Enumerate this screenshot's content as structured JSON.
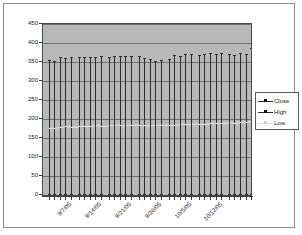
{
  "chart_data": {
    "type": "line",
    "title": "",
    "xlabel": "",
    "ylabel": "",
    "ylim": [
      0,
      450
    ],
    "ytick_labels": [
      "450",
      "400",
      "350",
      "300",
      "250",
      "200",
      "150",
      "100",
      "50",
      "0"
    ],
    "ytick_values": [
      450,
      400,
      350,
      300,
      250,
      200,
      150,
      100,
      50,
      0
    ],
    "grid": true,
    "legend_position": "right",
    "xtick_labels": [
      "9/7/05",
      "9/14/05",
      "9/21/05",
      "9/28/05",
      "10/5/05",
      "10/12/05"
    ],
    "xtick_positions": [
      3,
      8,
      13,
      18,
      23,
      28
    ],
    "categories": [
      "9/1/05",
      "9/2/05",
      "9/6/05",
      "9/7/05",
      "9/8/05",
      "9/9/05",
      "9/12/05",
      "9/13/05",
      "9/14/05",
      "9/15/05",
      "9/16/05",
      "9/19/05",
      "9/20/05",
      "9/21/05",
      "9/22/05",
      "9/23/05",
      "9/26/05",
      "9/27/05",
      "9/28/05",
      "9/29/05",
      "9/30/05",
      "10/3/05",
      "10/4/05",
      "10/5/05",
      "10/6/05",
      "10/7/05",
      "10/10/05",
      "10/11/05",
      "10/12/05",
      "10/13/05",
      "10/14/05",
      "10/17/05",
      "10/18/05",
      "10/19/05",
      "10/20/05"
    ],
    "series": [
      {
        "name": "High",
        "color": "#2b2b2b",
        "values": [
          355,
          352,
          362,
          360,
          363,
          362,
          363,
          364,
          364,
          365,
          364,
          367,
          366,
          365,
          367,
          366,
          361,
          357,
          353,
          356,
          358,
          368,
          367,
          370,
          372,
          368,
          371,
          374,
          372,
          373,
          370,
          369,
          374,
          372,
          388
        ]
      },
      {
        "name": "Low",
        "color": "#e8e8e8",
        "values": [
          176,
          177,
          180,
          181,
          180,
          181,
          182,
          182,
          183,
          182,
          183,
          183,
          184,
          183,
          184,
          185,
          184,
          183,
          183,
          184,
          185,
          185,
          186,
          187,
          186,
          187,
          188,
          189,
          190,
          190,
          191,
          190,
          192,
          193,
          196
        ]
      },
      {
        "name": "Close",
        "color": "#3a3a3a",
        "values": [
          178,
          179,
          182,
          183,
          182,
          183,
          184,
          184,
          185,
          184,
          185,
          185,
          186,
          185,
          186,
          187,
          186,
          185,
          185,
          186,
          187,
          187,
          188,
          189,
          188,
          189,
          190,
          191,
          192,
          192,
          193,
          192,
          194,
          195,
          198
        ]
      }
    ]
  },
  "legend": {
    "items": [
      {
        "label": "Close",
        "color": "#2b2b2b",
        "marker": "square-line"
      },
      {
        "label": "High",
        "color": "#2b2b2b",
        "marker": "square-line"
      },
      {
        "label": "Low",
        "color": "#dcdcdc",
        "marker": "square"
      }
    ]
  },
  "colors": {
    "plot_background": "#b8b8b8",
    "gridline": "#6f6f6f",
    "axis": "#3a3a3a",
    "page_background": "#ffffff",
    "frame_border": "#8a8a8a"
  }
}
